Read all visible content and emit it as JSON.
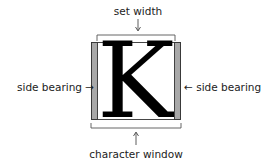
{
  "diagram": {
    "title_top": "set width",
    "title_bottom": "character window",
    "left_label": "side bearing",
    "right_label": "side bearing",
    "glyph": "K",
    "arrows": {
      "left": "→",
      "right": "←"
    },
    "colors": {
      "side_bearing_fill": "#a8a8a8",
      "outline": "#333333",
      "glyph": "#000000"
    }
  }
}
